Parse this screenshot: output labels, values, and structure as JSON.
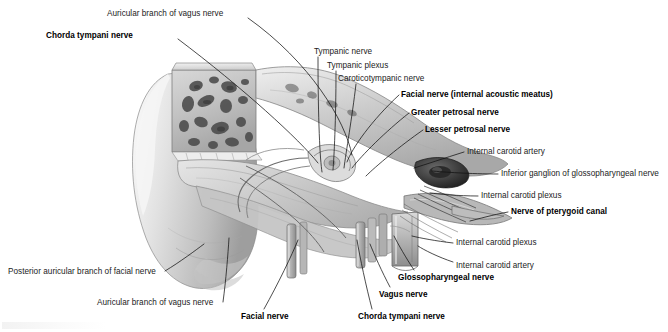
{
  "figure": {
    "background_color": "#ffffff",
    "text_color": "#1b1b1b",
    "leader_color": "#111111",
    "width": 668,
    "height": 332
  },
  "labels": [
    {
      "id": "auricular-branch-vagus-top",
      "text": "Auricular branch of vagus nerve",
      "bold": false,
      "x": 107,
      "y": 10,
      "align": "left",
      "leader": [
        [
          248,
          18
        ],
        [
          310,
          62
        ],
        [
          345,
          120
        ],
        [
          352,
          155
        ]
      ]
    },
    {
      "id": "chorda-tympani-top",
      "text": "Chorda tympani nerve",
      "bold": true,
      "x": 46,
      "y": 32,
      "align": "left",
      "leader": [
        [
          178,
          39
        ],
        [
          243,
          88
        ],
        [
          300,
          140
        ],
        [
          318,
          163
        ]
      ]
    },
    {
      "id": "tympanic-nerve",
      "text": "Tympanic nerve",
      "bold": false,
      "x": 314,
      "y": 48,
      "align": "left",
      "leader": [
        [
          318,
          57
        ],
        [
          318,
          120
        ],
        [
          320,
          160
        ],
        [
          322,
          172
        ]
      ]
    },
    {
      "id": "tympanic-plexus",
      "text": "Tympanic plexus",
      "bold": false,
      "x": 327,
      "y": 62,
      "align": "left",
      "leader": [
        [
          336,
          71
        ],
        [
          336,
          120
        ],
        [
          334,
          158
        ],
        [
          333,
          170
        ]
      ]
    },
    {
      "id": "caroticotympanic-nerve",
      "text": "Caroticotympanic nerve",
      "bold": false,
      "x": 338,
      "y": 75,
      "align": "left",
      "leader": [
        [
          356,
          84
        ],
        [
          352,
          118
        ],
        [
          346,
          152
        ],
        [
          344,
          168
        ]
      ]
    },
    {
      "id": "facial-nerve-iam",
      "text": "Facial nerve (internal acoustic meatus)",
      "bold": true,
      "x": 401,
      "y": 91,
      "align": "left",
      "leader": [
        [
          399,
          95
        ],
        [
          372,
          120
        ],
        [
          352,
          148
        ],
        [
          347,
          162
        ]
      ]
    },
    {
      "id": "greater-petrosal-nerve",
      "text": "Greater petrosal nerve",
      "bold": true,
      "x": 411,
      "y": 109,
      "align": "left",
      "leader": [
        [
          409,
          113
        ],
        [
          385,
          132
        ],
        [
          362,
          155
        ],
        [
          352,
          168
        ]
      ]
    },
    {
      "id": "lesser-petrosal-nerve",
      "text": "Lesser petrosal nerve",
      "bold": true,
      "x": 425,
      "y": 126,
      "align": "left",
      "leader": [
        [
          423,
          130
        ],
        [
          400,
          146
        ],
        [
          376,
          166
        ],
        [
          366,
          176
        ]
      ]
    },
    {
      "id": "internal-carotid-artery-upper",
      "text": "Internal carotid artery",
      "bold": false,
      "x": 467,
      "y": 148,
      "align": "left",
      "leader": [
        [
          464,
          152
        ],
        [
          445,
          158
        ],
        [
          424,
          165
        ],
        [
          414,
          168
        ]
      ]
    },
    {
      "id": "inferior-ganglion-glossopharyngeal",
      "text": "Inferior ganglion of glossopharyngeal nerve",
      "bold": false,
      "x": 501,
      "y": 170,
      "align": "left",
      "leader": [
        [
          498,
          174
        ],
        [
          470,
          174
        ],
        [
          443,
          172
        ],
        [
          432,
          171
        ]
      ]
    },
    {
      "id": "internal-carotid-plexus-upper",
      "text": "Internal carotid plexus",
      "bold": false,
      "x": 481,
      "y": 192,
      "align": "left",
      "leader": [
        [
          478,
          196
        ],
        [
          458,
          196
        ],
        [
          438,
          194
        ],
        [
          430,
          193
        ]
      ]
    },
    {
      "id": "nerve-of-pterygoid-canal",
      "text": "Nerve of pterygoid canal",
      "bold": true,
      "x": 511,
      "y": 208,
      "align": "left",
      "leader": [
        [
          508,
          212
        ],
        [
          492,
          215
        ],
        [
          478,
          219
        ],
        [
          470,
          221
        ]
      ]
    },
    {
      "id": "internal-carotid-plexus-lower",
      "text": "Internal carotid plexus",
      "bold": false,
      "x": 456,
      "y": 239,
      "align": "left",
      "leader": [
        [
          453,
          243
        ],
        [
          436,
          241
        ],
        [
          420,
          238
        ],
        [
          412,
          236
        ]
      ]
    },
    {
      "id": "internal-carotid-artery-lower",
      "text": "Internal carotid artery",
      "bold": false,
      "x": 456,
      "y": 262,
      "align": "left",
      "leader": [
        [
          453,
          262
        ],
        [
          438,
          257
        ],
        [
          424,
          250
        ],
        [
          418,
          246
        ]
      ]
    },
    {
      "id": "glossopharyngeal-nerve",
      "text": "Glossopharyngeal nerve",
      "bold": true,
      "x": 398,
      "y": 274,
      "align": "left",
      "leader": [
        [
          414,
          270
        ],
        [
          406,
          258
        ],
        [
          398,
          244
        ],
        [
          394,
          236
        ]
      ]
    },
    {
      "id": "vagus-nerve",
      "text": "Vagus nerve",
      "bold": true,
      "x": 379,
      "y": 291,
      "align": "left",
      "leader": [
        [
          390,
          287
        ],
        [
          382,
          272
        ],
        [
          374,
          254
        ],
        [
          370,
          244
        ]
      ]
    },
    {
      "id": "chorda-tympani-bottom",
      "text": "Chorda tympani nerve",
      "bold": true,
      "x": 358,
      "y": 313,
      "align": "left",
      "leader": [
        [
          372,
          309
        ],
        [
          366,
          286
        ],
        [
          360,
          258
        ],
        [
          357,
          240
        ]
      ]
    },
    {
      "id": "facial-nerve-bottom",
      "text": "Facial nerve",
      "bold": true,
      "x": 241,
      "y": 313,
      "align": "left",
      "leader": [
        [
          264,
          309
        ],
        [
          278,
          284
        ],
        [
          292,
          255
        ],
        [
          298,
          240
        ]
      ]
    },
    {
      "id": "auricular-branch-vagus-bottom",
      "text": "Auricular branch of vagus nerve",
      "bold": false,
      "x": 97,
      "y": 299,
      "align": "left",
      "leader": [
        [
          223,
          302
        ],
        [
          226,
          280
        ],
        [
          228,
          254
        ],
        [
          229,
          238
        ]
      ]
    },
    {
      "id": "posterior-auricular-branch-facial",
      "text": "Posterior auricular branch of facial nerve",
      "bold": false,
      "x": 8,
      "y": 268,
      "align": "left",
      "leader": [
        [
          165,
          271
        ],
        [
          180,
          262
        ],
        [
          196,
          250
        ],
        [
          204,
          244
        ]
      ]
    }
  ]
}
